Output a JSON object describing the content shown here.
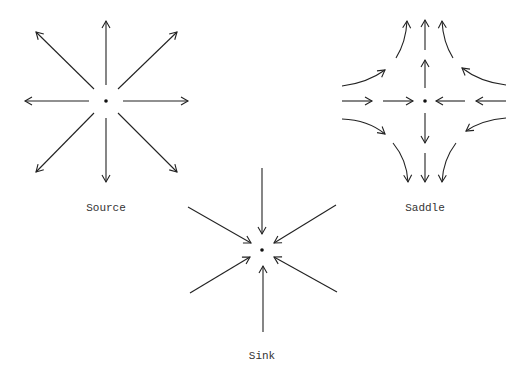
{
  "colors": {
    "stroke": "#222222",
    "text": "#333333"
  },
  "diagrams": [
    {
      "id": "source",
      "label": "Source",
      "type": "outward",
      "description": "all trajectories point away from the equilibrium"
    },
    {
      "id": "saddle",
      "label": "Saddle",
      "type": "saddle",
      "description": "horizontal flow inward, vertical flow outward, hyperbolic curves"
    },
    {
      "id": "sink",
      "label": "Sink",
      "type": "inward",
      "description": "all trajectories point toward the equilibrium"
    }
  ]
}
